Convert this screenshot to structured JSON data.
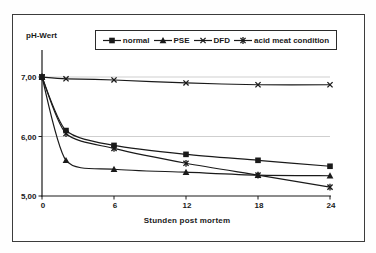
{
  "chart_data": {
    "type": "line",
    "title": "",
    "xlabel": "Stunden post mortem",
    "ylabel": "pH-Wert",
    "x": [
      0,
      2,
      6,
      12,
      18,
      24
    ],
    "x_ticks": [
      {
        "value": 0,
        "label": "0"
      },
      {
        "value": 6,
        "label": "6"
      },
      {
        "value": 12,
        "label": "12"
      },
      {
        "value": 18,
        "label": "18"
      },
      {
        "value": 24,
        "label": "24"
      }
    ],
    "y_ticks": [
      {
        "value": 5,
        "label": "5,00"
      },
      {
        "value": 6,
        "label": "6,00"
      },
      {
        "value": 7,
        "label": "7,00"
      }
    ],
    "xlim": [
      0,
      24
    ],
    "ylim": [
      5.0,
      7.5
    ],
    "grid": "horizontal-at-6-and-7",
    "legend_position": "top-boxed",
    "series": [
      {
        "name": "normal",
        "marker": "square",
        "values": [
          7.0,
          6.1,
          5.85,
          5.7,
          5.6,
          5.5
        ]
      },
      {
        "name": "PSE",
        "marker": "triangle",
        "values": [
          7.0,
          5.6,
          5.45,
          5.4,
          5.35,
          5.34
        ]
      },
      {
        "name": "DFD",
        "marker": "x",
        "values": [
          7.0,
          6.97,
          6.95,
          6.9,
          6.87,
          6.87
        ]
      },
      {
        "name": "acid meat condition",
        "marker": "star",
        "values": [
          7.0,
          6.05,
          5.8,
          5.55,
          5.35,
          5.15
        ]
      }
    ],
    "line_color": "#1a1a1a",
    "grid_color": "#c9c9c9"
  }
}
